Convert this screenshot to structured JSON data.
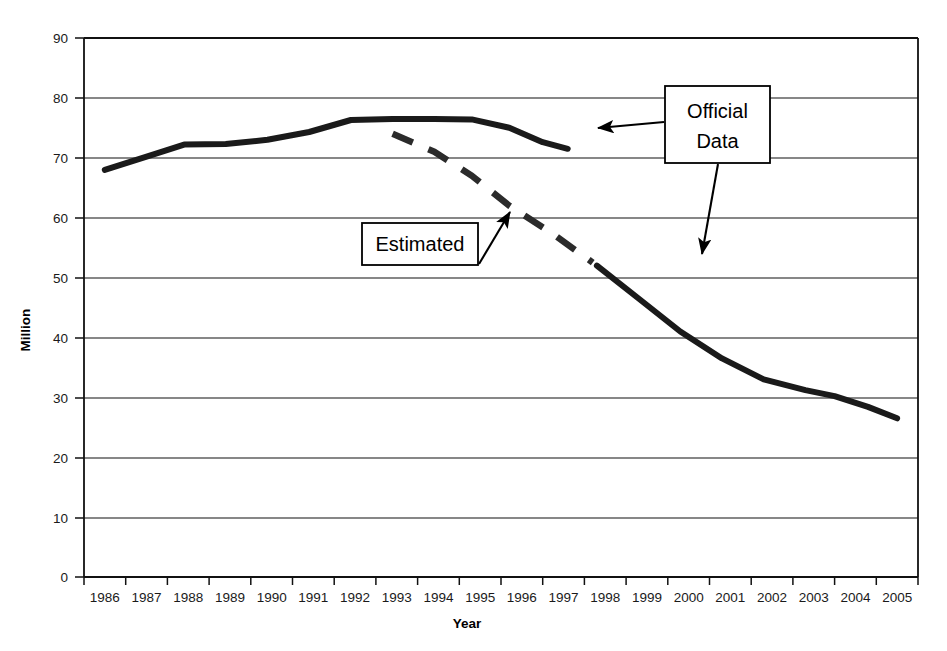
{
  "chart_data": {
    "type": "line",
    "title": "",
    "xlabel": "Year",
    "ylabel": "Million",
    "xlim": [
      1986,
      2006
    ],
    "ylim": [
      0,
      90
    ],
    "grid": true,
    "legend_position": "none",
    "x_tick_labels": [
      "1986",
      "1987",
      "1988",
      "1989",
      "1990",
      "1991",
      "1992",
      "1993",
      "1994",
      "1995",
      "1996",
      "1997",
      "1998",
      "1999",
      "2000",
      "2001",
      "2002",
      "2003",
      "2004",
      "2005"
    ],
    "y_tick_labels": [
      "0",
      "10",
      "20",
      "30",
      "40",
      "50",
      "60",
      "70",
      "80",
      "90"
    ],
    "y_ticks": [
      0,
      10,
      20,
      30,
      40,
      50,
      60,
      70,
      80,
      90
    ],
    "series": [
      {
        "name": "Official Data",
        "style": "solid",
        "color": "#1a1a1a",
        "x": [
          1986.5,
          1987.5,
          1988.4,
          1989.4,
          1990.4,
          1991.4,
          1992.4,
          1993.4,
          1994.4,
          1995.3,
          1996.2,
          1997.0,
          1997.6
        ],
        "values": [
          68.0,
          70.2,
          72.2,
          72.3,
          73.0,
          74.3,
          76.3,
          76.5,
          76.5,
          76.4,
          75.0,
          72.6,
          71.5
        ]
      },
      {
        "name": "Estimated",
        "style": "dashed",
        "color": "#2b2b2b",
        "x": [
          1993.4,
          1994.4,
          1995.3,
          1996.2,
          1997.2,
          1998.2
        ],
        "values": [
          74.0,
          71.0,
          67.0,
          62.0,
          57.5,
          52.5
        ]
      },
      {
        "name": "Projected continuation",
        "style": "solid",
        "color": "#1a1a1a",
        "x": [
          1998.3,
          1999.3,
          2000.3,
          2001.3,
          2002.3,
          2003.3,
          2004.0,
          2004.8,
          2005.5
        ],
        "values": [
          52.0,
          46.5,
          41.0,
          36.5,
          33.0,
          31.2,
          30.2,
          28.4,
          26.5
        ]
      }
    ],
    "annotations": [
      {
        "id": "official-data",
        "label_line_1": "Official",
        "label_line_2": "Data",
        "box": {
          "x": 665,
          "y": 86,
          "w": 105,
          "h": 77
        },
        "arrows": [
          {
            "from": [
              664,
              122
            ],
            "to": [
              598,
              128
            ]
          },
          {
            "from": [
              718,
              164
            ],
            "to": [
              702,
              254
            ]
          }
        ]
      },
      {
        "id": "estimated",
        "label_line_1": "Estimated",
        "label_line_2": "",
        "box": {
          "x": 362,
          "y": 223,
          "w": 116,
          "h": 42
        },
        "arrows": [
          {
            "from": [
              479,
              264
            ],
            "to": [
              510,
              212
            ]
          }
        ]
      }
    ]
  }
}
